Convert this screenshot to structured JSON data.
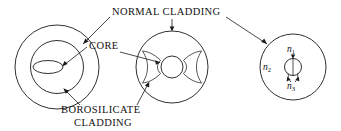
{
  "figure": {
    "type": "optical-fiber-cross-section-diagram",
    "background_color": "#ffffff",
    "line_color": "#1a1a1a",
    "labels": {
      "normal_cladding": "NORMAL  CLADDING",
      "core": "CORE",
      "borosilicate_line1": "BOROSILICATE",
      "borosilicate_line2": "CLADDING"
    },
    "indices": {
      "n1": "n",
      "n1_sub": "1",
      "n2": "n",
      "n2_sub": "2",
      "n3": "n",
      "n3_sub": "3"
    }
  }
}
